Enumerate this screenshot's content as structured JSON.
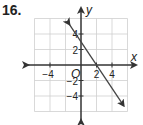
{
  "problem": {
    "number": "16."
  },
  "chart_data": {
    "type": "line",
    "title": "",
    "xlabel": "x",
    "ylabel": "y",
    "origin_label": "O",
    "xlim": [
      -6,
      6
    ],
    "ylim": [
      -6,
      6
    ],
    "grid": true,
    "grid_step": 2,
    "x_ticks": [
      {
        "value": -4,
        "label": "−4"
      },
      {
        "value": 2,
        "label": "2"
      },
      {
        "value": 4,
        "label": "4"
      }
    ],
    "y_ticks": [
      {
        "value": 4,
        "label": "4"
      },
      {
        "value": 2,
        "label": "2"
      },
      {
        "value": -2,
        "label": "−2"
      },
      {
        "value": -4,
        "label": "−4"
      }
    ],
    "series": [
      {
        "name": "line",
        "equation": "y = -3/2 x + 3",
        "x": [
          -1.5,
          0,
          2,
          5.5
        ],
        "y": [
          5.25,
          3,
          0,
          -5.25
        ],
        "color": "#444444",
        "arrows": "both"
      }
    ]
  }
}
